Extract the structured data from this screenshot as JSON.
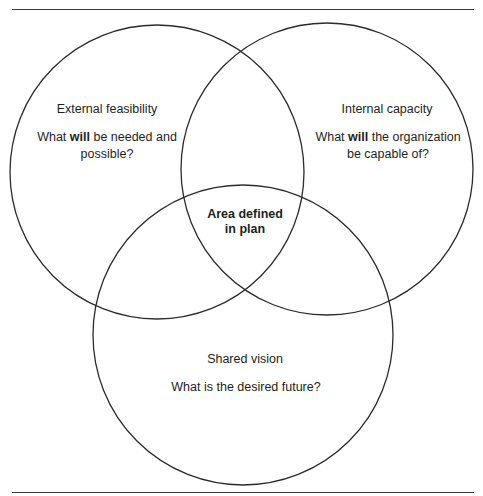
{
  "diagram": {
    "type": "venn",
    "circles": [
      {
        "id": "external",
        "title": "External feasibility",
        "question_pre": "What ",
        "question_bold": "will",
        "question_post_line1": " be needed and",
        "question_line2": "possible?"
      },
      {
        "id": "internal",
        "title": "Internal capacity",
        "question_pre": "What ",
        "question_bold": "will",
        "question_post_line1": " the organization",
        "question_line2": "be capable of?"
      },
      {
        "id": "shared",
        "title": "Shared vision",
        "question": "What is the desired future?"
      }
    ],
    "intersection": {
      "line1": "Area defined",
      "line2": "in plan"
    },
    "colors": {
      "stroke": "#2b2b2b",
      "background": "#ffffff",
      "text": "#1e1e1e"
    }
  }
}
